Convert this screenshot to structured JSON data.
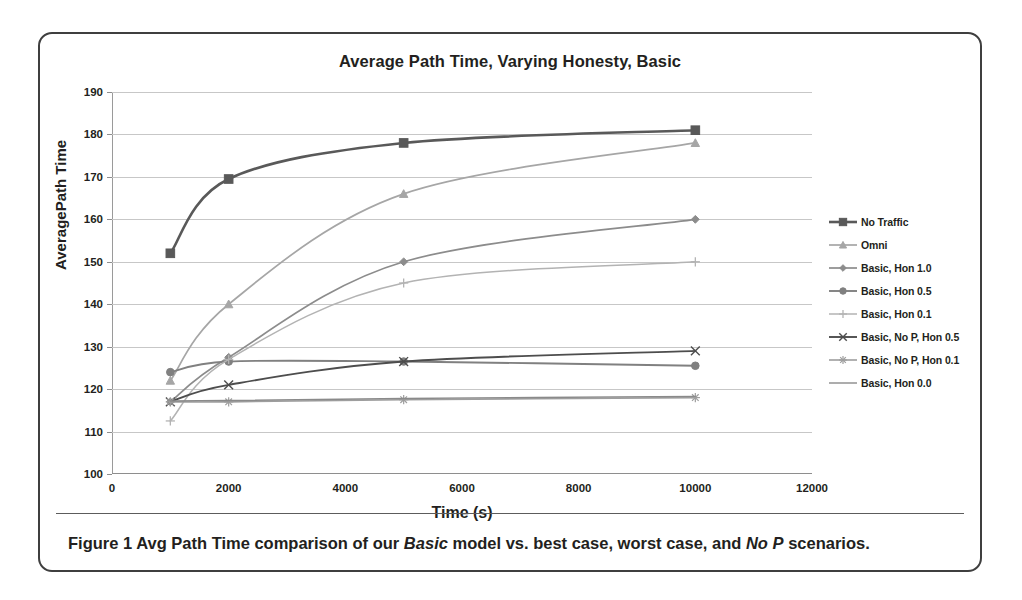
{
  "figure": {
    "title": "Average Path Time, Varying Honesty, Basic",
    "caption_prefix": "Figure 1 Avg Path Time comparison of our ",
    "caption_em1": "Basic",
    "caption_mid": " model vs. best case, worst case, and ",
    "caption_em2": "No P",
    "caption_suffix": " scenarios."
  },
  "chart_data": {
    "type": "line",
    "title": "Average Path Time, Varying Honesty, Basic",
    "xlabel": "Time (s)",
    "ylabel": "AveragePath Time",
    "xlim": [
      0,
      12000
    ],
    "ylim": [
      100,
      190
    ],
    "xticks": [
      0,
      2000,
      4000,
      6000,
      8000,
      10000,
      12000
    ],
    "yticks": [
      100,
      110,
      120,
      130,
      140,
      150,
      160,
      170,
      180,
      190
    ],
    "grid": "horizontal",
    "legend_position": "right",
    "x": [
      1000,
      2000,
      5000,
      10000
    ],
    "series": [
      {
        "name": "No Traffic",
        "values": [
          152.0,
          169.5,
          178.0,
          181.0
        ],
        "color": "#595959",
        "marker": "square",
        "width": 2.6
      },
      {
        "name": "Omni",
        "values": [
          122.0,
          140.0,
          166.0,
          178.0
        ],
        "color": "#a6a6a6",
        "marker": "triangle",
        "width": 1.7
      },
      {
        "name": "Basic, Hon 1.0",
        "values": [
          117.0,
          127.5,
          150.0,
          160.0
        ],
        "color": "#8c8c8c",
        "marker": "diamond",
        "width": 1.7
      },
      {
        "name": "Basic, Hon 0.5",
        "values": [
          124.0,
          126.5,
          126.5,
          125.5
        ],
        "color": "#808080",
        "marker": "circle",
        "width": 1.9
      },
      {
        "name": "Basic, Hon 0.1",
        "values": [
          112.5,
          127.0,
          145.0,
          150.0
        ],
        "color": "#b3b3b3",
        "marker": "plus",
        "width": 1.5
      },
      {
        "name": "Basic, No P, Hon 0.5",
        "values": [
          117.0,
          121.0,
          126.5,
          129.0
        ],
        "color": "#4d4d4d",
        "marker": "cross",
        "width": 1.9
      },
      {
        "name": "Basic, No P, Hon 0.1",
        "values": [
          117.0,
          117.0,
          117.5,
          118.0
        ],
        "color": "#9e9e9e",
        "marker": "star",
        "width": 1.6
      },
      {
        "name": "Basic, Hon 0.0",
        "values": [
          117.2,
          117.3,
          117.8,
          118.3
        ],
        "color": "#8a8a8a",
        "marker": "none",
        "width": 1.4
      }
    ]
  }
}
